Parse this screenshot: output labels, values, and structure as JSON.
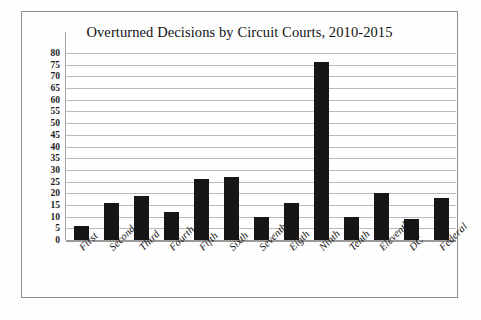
{
  "chart_data": {
    "type": "bar",
    "title": "Overturned Decisions by Circuit Courts, 2010-2015",
    "xlabel": "",
    "ylabel": "",
    "ylim": [
      0,
      80
    ],
    "ytick_step": 5,
    "grid": true,
    "legend": "none",
    "bar_color": "#161616",
    "grid_color": "#b9b9b9",
    "categories": [
      "First",
      "Second",
      "Third",
      "Fourth",
      "Fifth",
      "Sixth",
      "Seventh",
      "Eigth",
      "Ninth",
      "Tenth",
      "Eleventh",
      "DC",
      "Federal"
    ],
    "values": [
      6,
      16,
      19,
      12,
      26,
      27,
      10,
      16,
      76,
      10,
      20,
      9,
      18
    ],
    "yticks": [
      0,
      5,
      10,
      15,
      20,
      25,
      30,
      35,
      40,
      45,
      50,
      55,
      60,
      65,
      70,
      75,
      80
    ],
    "ytick_labels": [
      "0",
      "5",
      "10",
      "15",
      "20",
      "25",
      "30",
      "35",
      "40",
      "45",
      "50",
      "55",
      "60",
      "65",
      "70",
      "75",
      "80"
    ]
  }
}
